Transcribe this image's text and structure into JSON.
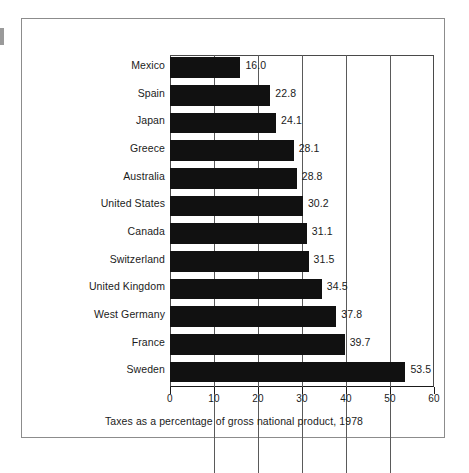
{
  "chart_data": {
    "type": "bar",
    "orientation": "horizontal",
    "title": "",
    "subtitle": "",
    "caption": "Taxes as a percentage of gross national product, 1978",
    "xlabel": "",
    "ylabel": "",
    "xlim": [
      0,
      60
    ],
    "xticks": [
      0,
      10,
      20,
      30,
      40,
      50,
      60
    ],
    "xtick_labels": [
      "0",
      "10",
      "20",
      "30",
      "40",
      "50",
      "60"
    ],
    "grid": true,
    "grid_axis": "x",
    "legend": false,
    "legend_position": "none",
    "bar_color": "#111111",
    "categories": [
      "Mexico",
      "Spain",
      "Japan",
      "Greece",
      "Australia",
      "United States",
      "Canada",
      "Switzerland",
      "United Kingdom",
      "West Germany",
      "France",
      "Sweden"
    ],
    "values": [
      16.0,
      22.8,
      24.1,
      28.1,
      28.8,
      30.2,
      31.1,
      31.5,
      34.5,
      37.8,
      39.7,
      53.5
    ],
    "value_labels": [
      "16.0",
      "22.8",
      "24.1",
      "28.1",
      "28.8",
      "30.2",
      "31.1",
      "31.5",
      "34.5",
      "37.8",
      "39.7",
      "53.5"
    ]
  },
  "colors": {
    "bar": "#111111",
    "frame": "#8c8c8c",
    "axis": "#1a1a1a",
    "grid": "#5a5a5a",
    "text": "#1b1b1b",
    "background": "#ffffff"
  }
}
